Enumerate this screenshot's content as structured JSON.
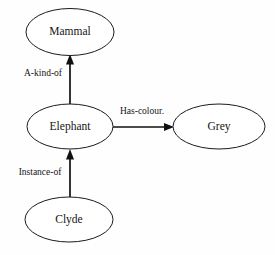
{
  "diagram": {
    "type": "semantic-network",
    "background_color": "#fefefe",
    "stroke_color": "#111111",
    "text_color": "#141414",
    "nodes": [
      {
        "id": "mammal",
        "label": "Mammal",
        "cx": 70,
        "cy": 32,
        "rx": 44,
        "ry": 23.5
      },
      {
        "id": "elephant",
        "label": "Elephant",
        "cx": 70,
        "cy": 126.5,
        "rx": 43,
        "ry": 22.5
      },
      {
        "id": "grey",
        "label": "Grey",
        "cx": 219,
        "cy": 126.5,
        "rx": 46,
        "ry": 22.5
      },
      {
        "id": "clyde",
        "label": "Clyde",
        "cx": 69,
        "cy": 219.5,
        "rx": 44,
        "ry": 22.5
      }
    ],
    "edges": [
      {
        "id": "a-kind-of",
        "label": "A-kind-of",
        "from": "elephant",
        "to": "mammal",
        "label_x": 43,
        "label_y": 74
      },
      {
        "id": "has-colour",
        "label": "Has-colour.",
        "from": "elephant",
        "to": "grey",
        "label_x": 142,
        "label_y": 112
      },
      {
        "id": "instance-of",
        "label": "Instance-of",
        "from": "clyde",
        "to": "elephant",
        "label_x": 40,
        "label_y": 173
      }
    ]
  }
}
